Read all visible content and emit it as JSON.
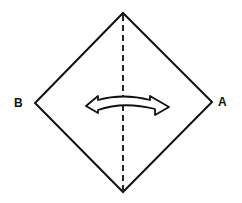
{
  "diagram": {
    "type": "origami-fold-step",
    "labels": {
      "left_corner": "B",
      "right_corner": "A"
    },
    "shape": "square-diamond",
    "fold_line": "vertical-dashed-valley",
    "arrow": "double-headed-curved",
    "colors": {
      "stroke": "#111111",
      "background": "#ffffff"
    }
  }
}
